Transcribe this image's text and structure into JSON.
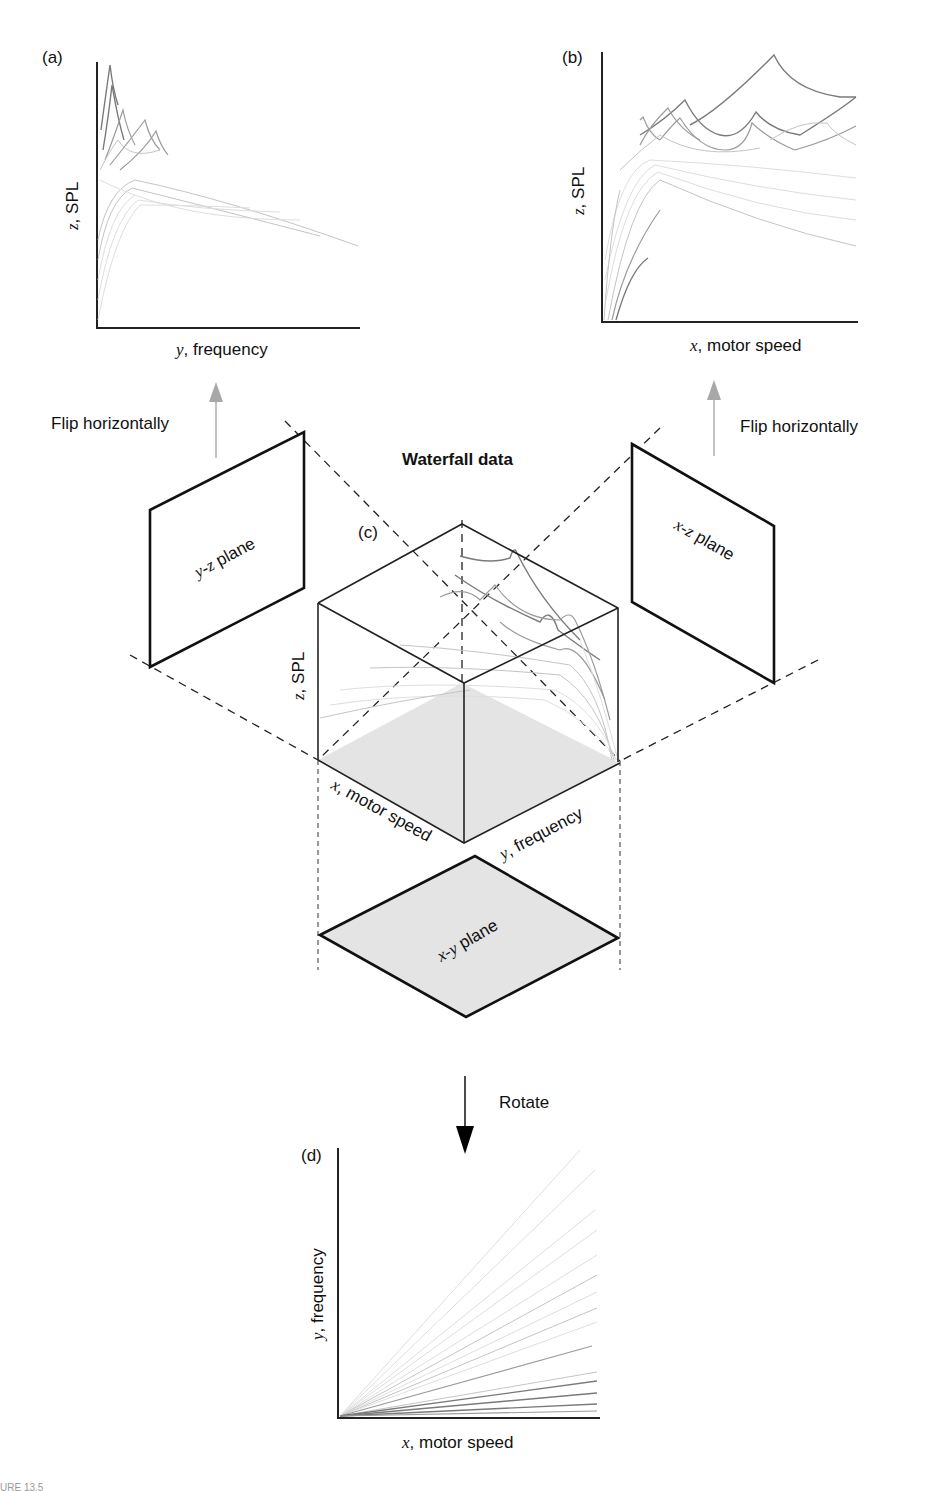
{
  "figure": {
    "title": "Waterfall data",
    "panels": {
      "a": {
        "tag": "(a)",
        "xlabel_var": "y",
        "xlabel_text": ", frequency",
        "ylabel_var": "z",
        "ylabel_text": ", SPL"
      },
      "b": {
        "tag": "(b)",
        "xlabel_var": "x",
        "xlabel_text": ", motor speed",
        "ylabel_var": "z",
        "ylabel_text": ", SPL"
      },
      "c": {
        "tag": "(c)",
        "z_label_var": "z",
        "z_label_text": ", SPL",
        "x_label_var": "x",
        "x_label_text": ", motor speed",
        "y_label_var": "y",
        "y_label_text": ", frequency"
      },
      "d": {
        "tag": "(d)",
        "xlabel_var": "x",
        "xlabel_text": ", motor speed",
        "ylabel_var": "y",
        "ylabel_text": ", frequency"
      }
    },
    "planes": {
      "yz": {
        "var": "y-z",
        "text": " plane"
      },
      "xz": {
        "var": "x-z",
        "text": " plane"
      },
      "xy": {
        "var": "x-y",
        "text": " plane"
      }
    },
    "arrows": {
      "left": "Flip horizontally",
      "right": "Flip horizontally",
      "down": "Rotate"
    },
    "colors": {
      "flip_arrow": "#a8a8a8",
      "rotate_arrow": "#000000",
      "plane_fill": "#e4e4e4"
    },
    "caption_partial": "URE 13.5"
  }
}
